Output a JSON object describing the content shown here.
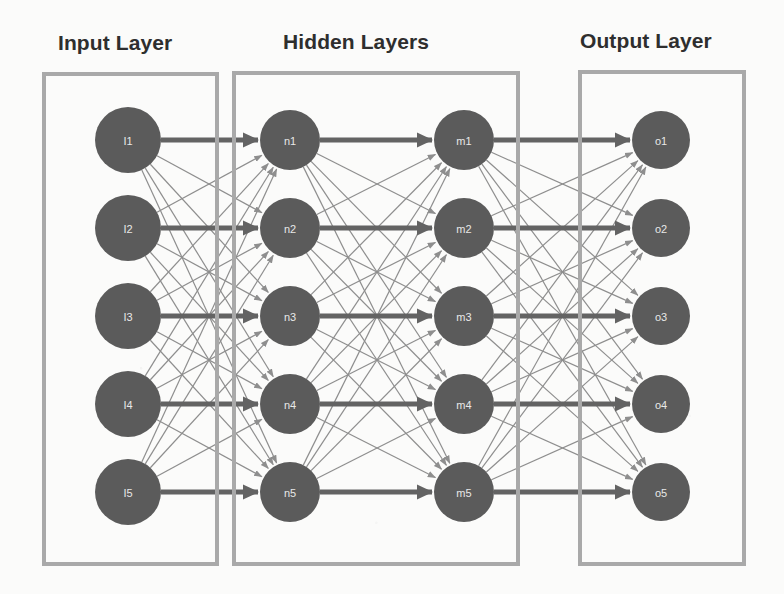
{
  "diagram": {
    "title_visible": false,
    "background_color": "#fbfbfa",
    "node_color": "#5b5b5b",
    "node_label_color": "#e8e8e8",
    "box_border_color": "#a9a9a9",
    "edge_color": "#8e8e8e",
    "main_edge_color": "#636363"
  },
  "titles": {
    "input": "Input Layer",
    "hidden": "Hidden Layers",
    "output": "Output Layer"
  },
  "layers": [
    {
      "id": "input",
      "name": "Input Layer",
      "cx": 128,
      "radius": 33,
      "nodes": [
        {
          "label": "I1",
          "cy": 140
        },
        {
          "label": "I2",
          "cy": 228
        },
        {
          "label": "I3",
          "cy": 316
        },
        {
          "label": "I4",
          "cy": 404
        },
        {
          "label": "I5",
          "cy": 492
        }
      ]
    },
    {
      "id": "hidden1",
      "name": "Hidden Layer 1",
      "cx": 290,
      "radius": 30,
      "nodes": [
        {
          "label": "n1",
          "cy": 140
        },
        {
          "label": "n2",
          "cy": 228
        },
        {
          "label": "n3",
          "cy": 316
        },
        {
          "label": "n4",
          "cy": 404
        },
        {
          "label": "n5",
          "cy": 492
        }
      ]
    },
    {
      "id": "hidden2",
      "name": "Hidden Layer 2",
      "cx": 464,
      "radius": 30,
      "nodes": [
        {
          "label": "m1",
          "cy": 140
        },
        {
          "label": "m2",
          "cy": 228
        },
        {
          "label": "m3",
          "cy": 316
        },
        {
          "label": "m4",
          "cy": 404
        },
        {
          "label": "m5",
          "cy": 492
        }
      ]
    },
    {
      "id": "output",
      "name": "Output Layer",
      "cx": 661,
      "radius": 29,
      "nodes": [
        {
          "label": "o1",
          "cy": 140
        },
        {
          "label": "o2",
          "cy": 228
        },
        {
          "label": "o3",
          "cy": 316
        },
        {
          "label": "o4",
          "cy": 404
        },
        {
          "label": "o5",
          "cy": 492
        }
      ]
    }
  ],
  "connections": {
    "style": "fully-connected",
    "directed": true,
    "arrowheads": true,
    "emphasized_pairs": [
      [
        0,
        0
      ],
      [
        1,
        1
      ],
      [
        2,
        2
      ],
      [
        3,
        3
      ],
      [
        4,
        4
      ]
    ],
    "description": "Each layer is fully connected to the next layer; horizontal same-index links are drawn thicker."
  },
  "boxes": [
    {
      "id": "box-input",
      "label": "Input Layer"
    },
    {
      "id": "box-hidden",
      "label": "Hidden Layers"
    },
    {
      "id": "box-output",
      "label": "Output Layer"
    }
  ]
}
